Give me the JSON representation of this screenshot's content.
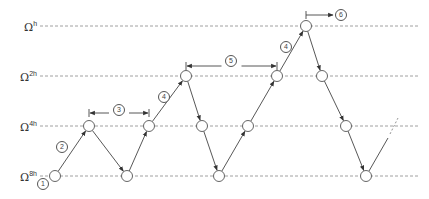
{
  "diagram": {
    "type": "multigrid-cycle",
    "colors": {
      "line": "#444444",
      "grid_dash": "#888888",
      "node_fill": "#ffffff",
      "node_stroke": "#555555"
    },
    "levels": [
      {
        "id": "h",
        "label": "Ω",
        "sup": "h",
        "y": 26
      },
      {
        "id": "2h",
        "label": "Ω",
        "sup": "2h",
        "y": 76
      },
      {
        "id": "4h",
        "label": "Ω",
        "sup": "4h",
        "y": 126
      },
      {
        "id": "8h",
        "label": "Ω",
        "sup": "8h",
        "y": 176
      }
    ],
    "nodes": [
      {
        "x": 55,
        "level": "8h"
      },
      {
        "x": 89,
        "level": "4h"
      },
      {
        "x": 127,
        "level": "8h"
      },
      {
        "x": 149,
        "level": "4h"
      },
      {
        "x": 186,
        "level": "2h"
      },
      {
        "x": 202,
        "level": "4h"
      },
      {
        "x": 219,
        "level": "8h"
      },
      {
        "x": 248,
        "level": "4h"
      },
      {
        "x": 277,
        "level": "2h"
      },
      {
        "x": 306,
        "level": "h"
      },
      {
        "x": 322,
        "level": "2h"
      },
      {
        "x": 346,
        "level": "4h"
      },
      {
        "x": 366,
        "level": "8h"
      }
    ],
    "step_labels": [
      {
        "text": "1",
        "x": 43,
        "y": 184
      },
      {
        "text": "2",
        "x": 62,
        "y": 147
      },
      {
        "text": "3",
        "x": 119,
        "y": 110
      },
      {
        "text": "4",
        "x": 164,
        "y": 97
      },
      {
        "text": "5",
        "x": 231,
        "y": 61
      },
      {
        "text": "4",
        "x": 286,
        "y": 47
      },
      {
        "text": "6",
        "x": 341,
        "y": 15
      }
    ],
    "span_arrows": [
      {
        "label": "3",
        "x1": 89,
        "x2": 149,
        "y": 113
      },
      {
        "label": "5",
        "x1": 186,
        "x2": 277,
        "y": 66
      },
      {
        "label": "6",
        "x1": 306,
        "x2": 333,
        "y": 15
      }
    ]
  }
}
